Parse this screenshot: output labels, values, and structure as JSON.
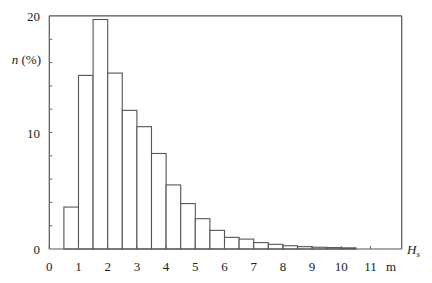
{
  "chart_data": {
    "type": "bar",
    "title": "",
    "xlabel": "H_s",
    "xunit": "m",
    "ylabel": "n (%)",
    "xlim": [
      0,
      12
    ],
    "ylim": [
      0,
      20
    ],
    "grid": false,
    "legend": null,
    "bin_width": 0.5,
    "bins": [
      {
        "x0": 0.5,
        "x1": 1.0,
        "value": 3.6
      },
      {
        "x0": 1.0,
        "x1": 1.5,
        "value": 14.9
      },
      {
        "x0": 1.5,
        "x1": 2.0,
        "value": 19.7
      },
      {
        "x0": 2.0,
        "x1": 2.5,
        "value": 15.1
      },
      {
        "x0": 2.5,
        "x1": 3.0,
        "value": 11.9
      },
      {
        "x0": 3.0,
        "x1": 3.5,
        "value": 10.5
      },
      {
        "x0": 3.5,
        "x1": 4.0,
        "value": 8.2
      },
      {
        "x0": 4.0,
        "x1": 4.5,
        "value": 5.5
      },
      {
        "x0": 4.5,
        "x1": 5.0,
        "value": 3.9
      },
      {
        "x0": 5.0,
        "x1": 5.5,
        "value": 2.6
      },
      {
        "x0": 5.5,
        "x1": 6.0,
        "value": 1.6
      },
      {
        "x0": 6.0,
        "x1": 6.5,
        "value": 1.0
      },
      {
        "x0": 6.5,
        "x1": 7.0,
        "value": 0.85
      },
      {
        "x0": 7.0,
        "x1": 7.5,
        "value": 0.55
      },
      {
        "x0": 7.5,
        "x1": 8.0,
        "value": 0.4
      },
      {
        "x0": 8.0,
        "x1": 8.5,
        "value": 0.28
      },
      {
        "x0": 8.5,
        "x1": 9.0,
        "value": 0.2
      },
      {
        "x0": 9.0,
        "x1": 9.5,
        "value": 0.15
      },
      {
        "x0": 9.5,
        "x1": 10.0,
        "value": 0.12
      },
      {
        "x0": 10.0,
        "x1": 10.5,
        "value": 0.1
      }
    ],
    "x_ticks": [
      0,
      1,
      2,
      3,
      4,
      5,
      6,
      7,
      8,
      9,
      10,
      11
    ],
    "y_ticks": [
      0,
      10,
      20
    ]
  },
  "labels": {
    "ylabel_main": "n",
    "ylabel_unit": " (%)",
    "xlabel_main": "H",
    "xlabel_sub": "s",
    "xunit": "m"
  }
}
